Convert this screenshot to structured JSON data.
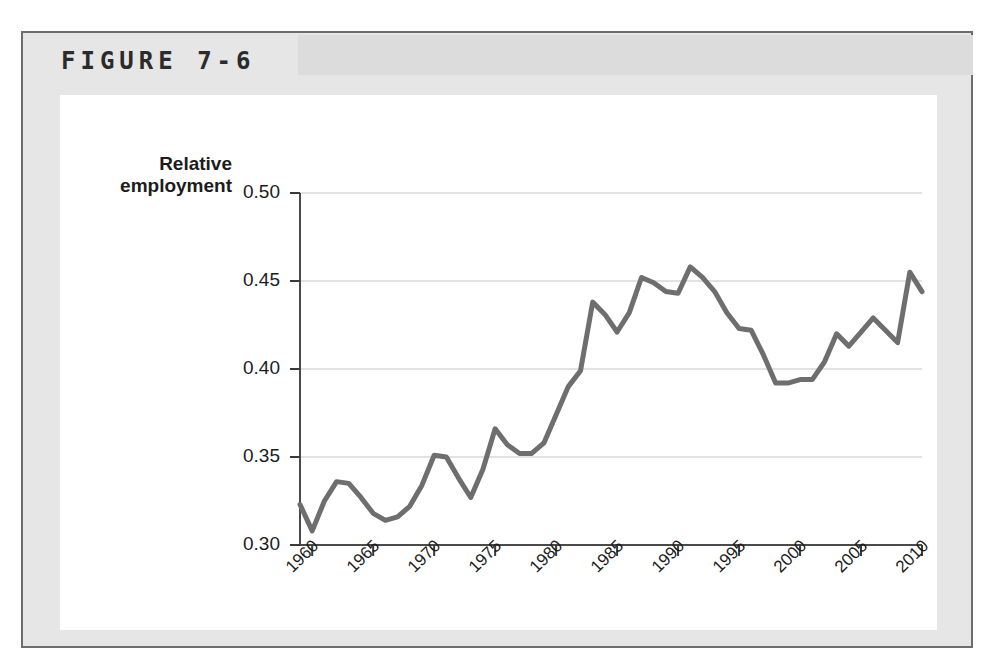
{
  "figure": {
    "title": "FIGURE 7-6"
  },
  "chart_data": {
    "type": "line",
    "title": "",
    "subtitle": "",
    "xlabel": "",
    "ylabel": "Relative employment",
    "ylabel_line1": "Relative",
    "ylabel_line2": "employment",
    "xlim": [
      1959,
      2010
    ],
    "ylim": [
      0.3,
      0.5
    ],
    "yticks": [
      0.3,
      0.35,
      0.4,
      0.45,
      0.5
    ],
    "ytick_labels": [
      "0.30",
      "0.35",
      "0.40",
      "0.45",
      "0.50"
    ],
    "xticks": [
      1960,
      1965,
      1970,
      1975,
      1980,
      1985,
      1990,
      1995,
      2000,
      2005,
      2010
    ],
    "xtick_labels": [
      "1960",
      "1965",
      "1970",
      "1975",
      "1980",
      "1985",
      "1990",
      "1995",
      "2000",
      "2005",
      "2010"
    ],
    "grid": "horizontal",
    "legend": "none",
    "line_color": "#6e6e6e",
    "line_width": 5,
    "series": [
      {
        "name": "Relative employment",
        "x": [
          1959,
          1960,
          1961,
          1962,
          1963,
          1964,
          1965,
          1966,
          1967,
          1968,
          1969,
          1970,
          1971,
          1972,
          1973,
          1974,
          1975,
          1976,
          1977,
          1978,
          1979,
          1980,
          1981,
          1982,
          1983,
          1984,
          1985,
          1986,
          1987,
          1988,
          1989,
          1990,
          1991,
          1992,
          1993,
          1994,
          1995,
          1996,
          1997,
          1998,
          1999,
          2000,
          2001,
          2002,
          2003,
          2004,
          2005,
          2006,
          2007,
          2008,
          2009,
          2010
        ],
        "values": [
          0.323,
          0.308,
          0.325,
          0.336,
          0.335,
          0.327,
          0.318,
          0.314,
          0.316,
          0.322,
          0.334,
          0.351,
          0.35,
          0.338,
          0.327,
          0.343,
          0.366,
          0.357,
          0.352,
          0.352,
          0.358,
          0.374,
          0.39,
          0.399,
          0.438,
          0.431,
          0.421,
          0.432,
          0.452,
          0.449,
          0.444,
          0.443,
          0.458,
          0.452,
          0.444,
          0.432,
          0.423,
          0.422,
          0.408,
          0.392,
          0.392,
          0.394,
          0.394,
          0.404,
          0.42,
          0.413,
          0.421,
          0.429,
          0.422,
          0.415,
          0.455,
          0.444
        ]
      }
    ]
  }
}
